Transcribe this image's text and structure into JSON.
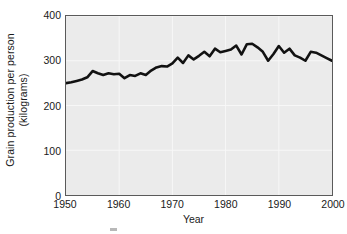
{
  "chart_data": {
    "type": "line",
    "title": "",
    "xlabel": "Year",
    "ylabel_line1": "Grain production per person",
    "ylabel_line2": "(kilograms)",
    "ylabel": "Grain production per person (kilograms)",
    "xlim": [
      1950,
      2000
    ],
    "ylim": [
      0,
      400
    ],
    "xticks": [
      1950,
      1960,
      1970,
      1980,
      1990,
      2000
    ],
    "xtick_labels": [
      "1950",
      "1960",
      "1970",
      "1980",
      "1990",
      "2000"
    ],
    "yticks": [
      0,
      100,
      200,
      300,
      400
    ],
    "ytick_labels": [
      "0",
      "100",
      "200",
      "300",
      "400"
    ],
    "grid": true,
    "grid_color": "#f7f7f7",
    "plot_bg": "#ebebeb",
    "frame_color": "#5a5a5a",
    "line_color": "#111111",
    "line_width": 2.6,
    "legend": null,
    "series": [
      {
        "name": "Grain production per person",
        "x": [
          1950,
          1951,
          1952,
          1953,
          1954,
          1955,
          1956,
          1957,
          1958,
          1959,
          1960,
          1961,
          1962,
          1963,
          1964,
          1965,
          1966,
          1967,
          1968,
          1969,
          1970,
          1971,
          1972,
          1973,
          1974,
          1975,
          1976,
          1977,
          1978,
          1979,
          1980,
          1981,
          1982,
          1983,
          1984,
          1985,
          1986,
          1987,
          1988,
          1989,
          1990,
          1991,
          1992,
          1993,
          1994,
          1995,
          1996,
          1997,
          1998,
          1999,
          2000
        ],
        "values": [
          250,
          252,
          255,
          258,
          263,
          277,
          272,
          268,
          272,
          270,
          271,
          261,
          268,
          266,
          272,
          268,
          278,
          285,
          288,
          287,
          294,
          307,
          295,
          312,
          303,
          311,
          320,
          310,
          327,
          319,
          322,
          325,
          334,
          314,
          337,
          338,
          330,
          320,
          300,
          315,
          333,
          318,
          327,
          312,
          307,
          300,
          320,
          318,
          312,
          306,
          300
        ]
      }
    ]
  }
}
